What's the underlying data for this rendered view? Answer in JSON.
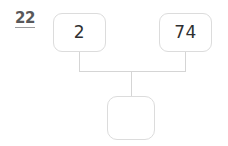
{
  "worksheet": {
    "question_number": "22",
    "type": "number-bond",
    "accent_color": "#58585a",
    "box_border_color": "#dcdcdc",
    "connector_color": "#d5d5d5",
    "background_color": "#ffffff"
  },
  "number_bond": {
    "parts": [
      {
        "id": "addend-1",
        "value": "2",
        "empty": false
      },
      {
        "id": "addend-2",
        "value": "74",
        "empty": false
      }
    ],
    "total": {
      "id": "answer",
      "value": "",
      "empty": true
    }
  }
}
